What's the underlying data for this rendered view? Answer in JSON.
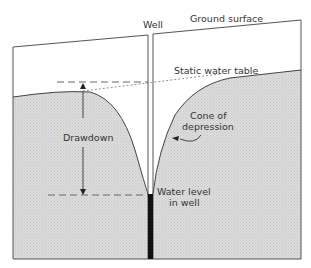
{
  "diagram": {
    "labels": {
      "well": "Well",
      "ground_surface": "Ground surface",
      "static_water_table": "Static water table",
      "cone_line1": "Cone of",
      "cone_line2": "depression",
      "drawdown": "Drawdown",
      "water_level_line1": "Water level",
      "water_level_line2": "in well"
    },
    "colors": {
      "saturated_zone": "#d9d9d9",
      "outline": "#444444",
      "well_water": "#111111",
      "background": "#ffffff"
    }
  }
}
